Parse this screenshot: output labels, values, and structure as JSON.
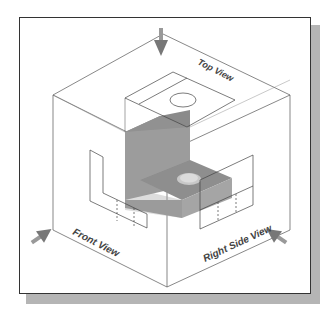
{
  "labels": {
    "top_view": "Top View",
    "front_view": "Front View",
    "right_side_view": "Right Side View"
  },
  "colors": {
    "frame_border": "#333333",
    "shadow": "#b5b5b5",
    "line": "#444444",
    "solid_front": "#9a9a9a",
    "solid_top": "#8c8c8c",
    "solid_side": "#a8a8a8",
    "arrow": "#8a8a8a"
  }
}
